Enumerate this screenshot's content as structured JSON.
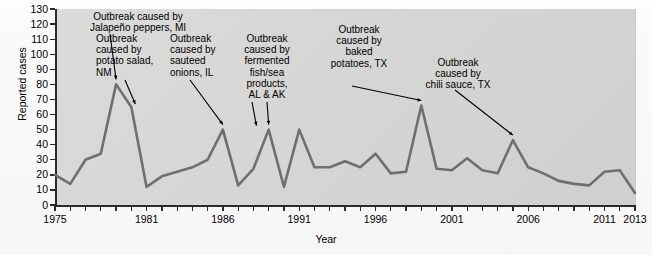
{
  "chart_data": {
    "type": "line",
    "title": "",
    "xlabel": "Year",
    "ylabel": "Reported cases",
    "xlim": [
      1975,
      2013
    ],
    "ylim": [
      0,
      130
    ],
    "ytick_labels": [
      "0",
      "10",
      "20",
      "30",
      "40",
      "50",
      "60",
      "70",
      "80",
      "90",
      "100",
      "110",
      "120",
      "130"
    ],
    "ytick_values": [
      0,
      10,
      20,
      30,
      40,
      50,
      60,
      70,
      80,
      90,
      100,
      110,
      120,
      130
    ],
    "xtick_labels": [
      "1975",
      "1981",
      "1986",
      "1991",
      "1996",
      "2001",
      "2006",
      "2011",
      "2013"
    ],
    "xtick_values": [
      1975,
      1981,
      1986,
      1991,
      1996,
      2001,
      2006,
      2011,
      2013
    ],
    "grid": false,
    "legend": "none",
    "line_color": "#6f6f6f",
    "panel_color": "#d7d7d5",
    "x": [
      1975,
      1976,
      1977,
      1978,
      1979,
      1980,
      1981,
      1982,
      1983,
      1984,
      1985,
      1986,
      1987,
      1988,
      1989,
      1990,
      1991,
      1992,
      1993,
      1994,
      1995,
      1996,
      1997,
      1998,
      1999,
      2000,
      2001,
      2002,
      2003,
      2004,
      2005,
      2006,
      2007,
      2008,
      2009,
      2010,
      2011,
      2012,
      2013
    ],
    "values": [
      20,
      14,
      30,
      34,
      80,
      65,
      12,
      19,
      22,
      25,
      30,
      50,
      13,
      24,
      50,
      12,
      50,
      25,
      25,
      29,
      25,
      34,
      21,
      22,
      66,
      24,
      23,
      31,
      23,
      21,
      43,
      25,
      21,
      16,
      14,
      13,
      22,
      23,
      8
    ],
    "annotations": [
      {
        "text": "Outbreak caused by\nJalapeño peppers, MI",
        "year": 1979,
        "value": 80,
        "align": "center"
      },
      {
        "text": "Outbreak\ncaused by\npotato salad,\nNM",
        "year": 1980,
        "value": 65,
        "align": "left"
      },
      {
        "text": "Outbreak\ncaused by\nsauteed\nonions, IL",
        "year": 1986,
        "value": 50,
        "align": "left"
      },
      {
        "text": "Outbreak\ncaused by\nfermented\nfish/sea\nproducts,\nAL & AK",
        "year": 1989,
        "value": 50,
        "align": "center"
      },
      {
        "text": "Outbreak\ncaused by\nbaked\npotatoes, TX",
        "year": 1999,
        "value": 66,
        "align": "center"
      },
      {
        "text": "Outbreak\ncaused by\nchili sauce, TX",
        "year": 2005,
        "value": 43,
        "align": "center"
      }
    ]
  },
  "axes": {
    "y_title": "Reported cases",
    "x_title": "Year",
    "y_labels": [
      "130",
      "120",
      "110",
      "100",
      "90",
      "80",
      "70",
      "60",
      "50",
      "40",
      "30",
      "20",
      "10",
      "0"
    ],
    "x_labels": [
      "1975",
      "1981",
      "1986",
      "1991",
      "1996",
      "2001",
      "2006",
      "2011",
      "2013"
    ]
  },
  "annotations": {
    "a1": "Outbreak caused by\nJalapeño peppers, MI",
    "a2": "Outbreak\ncaused by\npotato salad,\nNM",
    "a3": "Outbreak\ncaused by\nsauteed\nonions, IL",
    "a4": "Outbreak\ncaused by\nfermented\nfish/sea\nproducts,\nAL & AK",
    "a5": "Outbreak\ncaused by\nbaked\npotatoes, TX",
    "a6": "Outbreak\ncaused by\nchili sauce, TX"
  }
}
